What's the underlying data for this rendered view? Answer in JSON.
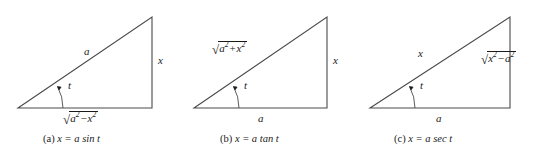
{
  "figure": {
    "type": "trigonometric-substitution-triangles",
    "background_color": "#ffffff",
    "stroke_color": "#4a4a4a",
    "text_color": "#1a1a1a",
    "panels": [
      {
        "id": "a",
        "caption": "(a) x = a sin t",
        "caption_letter": "(a)",
        "caption_equation": "x = a sin t",
        "angle_label": "t",
        "hypotenuse_label": "a",
        "vertical_label": "x",
        "base_label": "√(a² − x²)",
        "base_radicand_first": "a",
        "base_radicand_op": "−",
        "base_radicand_second": "x",
        "base_exponent": "2",
        "vertices": {
          "left": "18,108",
          "right": "152,108",
          "apex": "152,17"
        }
      },
      {
        "id": "b",
        "caption": "(b) x = a tan t",
        "caption_letter": "(b)",
        "caption_equation": "x = a tan t",
        "angle_label": "t",
        "hypotenuse_label": "√(a² + x²)",
        "hyp_radicand_first": "a",
        "hyp_radicand_op": "+",
        "hyp_radicand_second": "x",
        "hyp_exponent": "2",
        "vertical_label": "x",
        "base_label": "a",
        "vertices": {
          "left": "12,108",
          "right": "145,108",
          "apex": "145,17"
        }
      },
      {
        "id": "c",
        "caption": "(c) x = a sec t",
        "caption_letter": "(c)",
        "caption_equation": "x = a sec t",
        "angle_label": "t",
        "hypotenuse_label": "x",
        "vertical_label": "√(x² − a²)",
        "vert_radicand_first": "x",
        "vert_radicand_op": "−",
        "vert_radicand_second": "a",
        "vert_exponent": "2",
        "base_label": "a",
        "vertices": {
          "left": "8,108",
          "right": "148,108",
          "apex": "148,17"
        }
      }
    ]
  }
}
